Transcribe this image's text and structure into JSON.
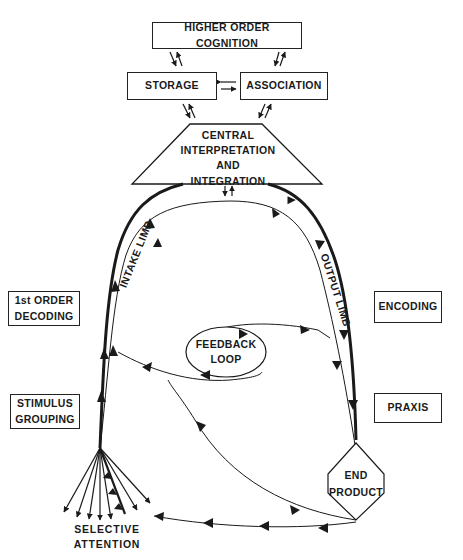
{
  "diagram": {
    "nodes": {
      "higher_order_cognition": "HIGHER ORDER COGNITION",
      "storage": "STORAGE",
      "association": "ASSOCIATION",
      "central": [
        "CENTRAL",
        "INTERPRETATION",
        "AND",
        "INTEGRATION"
      ],
      "first_order_decoding": [
        "1st ORDER",
        "DECODING"
      ],
      "stimulus_grouping": [
        "STIMULUS",
        "GROUPING"
      ],
      "encoding": "ENCODING",
      "praxis": "PRAXIS",
      "feedback_loop": [
        "FEEDBACK",
        "LOOP"
      ],
      "end_product": [
        "END",
        "PRODUCT"
      ],
      "selective_attention": "SELECTIVE ATTENTION"
    },
    "limbs": {
      "intake": "INTAKE LIMB",
      "output": "OUTPUT LIMB"
    },
    "colors": {
      "line": "#1a1a1a",
      "background": "#ffffff"
    }
  }
}
